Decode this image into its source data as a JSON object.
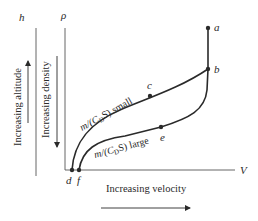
{
  "diagram": {
    "axes": {
      "altitude_symbol": "h",
      "density_symbol": "ρ",
      "velocity_symbol": "V"
    },
    "arrows": {
      "altitude_label": "Increasing altitude",
      "density_label": "Increasing density",
      "velocity_label": "Increasing velocity"
    },
    "curves": [
      {
        "label_prefix": "m/(C",
        "label_sub": "D",
        "label_suffix": "S) small",
        "points": [
          "d",
          "c",
          "b",
          "a"
        ]
      },
      {
        "label_prefix": "m/(C",
        "label_sub": "D",
        "label_suffix": "S) large",
        "points": [
          "f",
          "e",
          "b",
          "a"
        ]
      }
    ],
    "points": {
      "a": "a",
      "b": "b",
      "c": "c",
      "d": "d",
      "e": "e",
      "f": "f"
    },
    "colors": {
      "ink": "#2a2a2a",
      "axis": "#555555"
    }
  }
}
